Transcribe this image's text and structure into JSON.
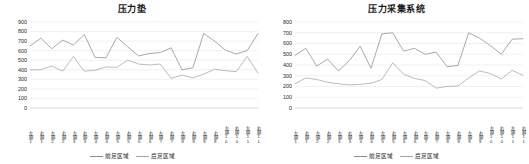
{
  "charts": [
    {
      "key": "pressure_mat",
      "title": "压力垫",
      "ylim": [
        0,
        900
      ],
      "ystep": 100,
      "legend": [
        "前足区域",
        "后足区域"
      ]
    },
    {
      "key": "pressure_acq",
      "title": "压力采集系统",
      "ylim": [
        0,
        800
      ],
      "ystep": 100,
      "legend": [
        "前足区域",
        "后足区域"
      ]
    }
  ],
  "chart_data": [
    {
      "type": "line",
      "title": "压力垫",
      "xlabel": "",
      "ylabel": "",
      "ylim": [
        0,
        900
      ],
      "yticks": [
        0,
        100,
        200,
        300,
        400,
        500,
        600,
        700,
        800,
        900
      ],
      "grid": true,
      "legend_position": "bottom",
      "categories": [
        "左脚1",
        "右脚1",
        "左脚2",
        "右脚2",
        "左脚3",
        "右脚3",
        "左脚4",
        "右脚4",
        "左脚5",
        "右脚5",
        "左脚6",
        "右脚6",
        "左脚7",
        "右脚7",
        "左脚8",
        "右脚8",
        "左脚9",
        "右脚9",
        "左脚10",
        "右脚10",
        "左脚11",
        "右脚11"
      ],
      "series": [
        {
          "name": "前足区域",
          "color": "#8c8c8c",
          "values": [
            650,
            730,
            620,
            710,
            660,
            770,
            530,
            525,
            740,
            640,
            545,
            570,
            580,
            630,
            400,
            420,
            780,
            700,
            605,
            565,
            600,
            780
          ]
        },
        {
          "name": "后足区域",
          "color": "#a6a6a6",
          "values": [
            400,
            400,
            440,
            385,
            540,
            385,
            395,
            430,
            425,
            500,
            460,
            450,
            460,
            310,
            345,
            315,
            355,
            405,
            390,
            380,
            540,
            365
          ]
        }
      ]
    },
    {
      "type": "line",
      "title": "压力采集系统",
      "xlabel": "",
      "ylabel": "",
      "ylim": [
        0,
        800
      ],
      "yticks": [
        0,
        100,
        200,
        300,
        400,
        500,
        600,
        700,
        800
      ],
      "grid": true,
      "legend_position": "bottom",
      "categories": [
        "左脚1",
        "右脚1",
        "左脚2",
        "右脚2",
        "左脚3",
        "右脚3",
        "左脚4",
        "右脚4",
        "左脚5",
        "右脚5",
        "左脚6",
        "右脚6",
        "左脚7",
        "右脚7",
        "左脚8",
        "右脚8",
        "左脚9",
        "右脚9",
        "左脚10",
        "右脚10",
        "左脚11",
        "右脚11"
      ],
      "series": [
        {
          "name": "前足区域",
          "color": "#8c8c8c",
          "values": [
            490,
            555,
            390,
            455,
            345,
            440,
            575,
            370,
            690,
            700,
            530,
            555,
            500,
            520,
            385,
            395,
            700,
            650,
            580,
            500,
            640,
            645
          ]
        },
        {
          "name": "后足区域",
          "color": "#a6a6a6",
          "values": [
            225,
            280,
            265,
            240,
            225,
            215,
            220,
            230,
            265,
            420,
            315,
            275,
            255,
            185,
            200,
            205,
            280,
            345,
            320,
            270,
            350,
            305
          ]
        }
      ]
    }
  ]
}
